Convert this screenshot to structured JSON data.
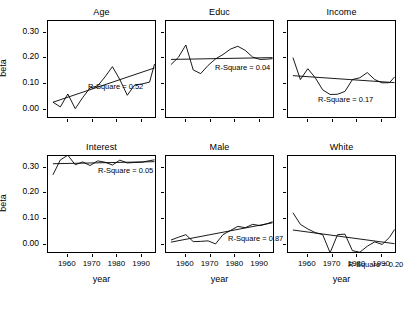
{
  "figure": {
    "xlabel": "year",
    "ylabel": "beta",
    "y_ticks": [
      "0.00",
      "0.10",
      "0.20",
      "0.30"
    ],
    "x_ticks": [
      "1960",
      "1970",
      "1980",
      "1990"
    ]
  },
  "chart_data": {
    "type": "line",
    "title": "",
    "xlabel": "year",
    "ylabel": "beta",
    "xlim": [
      1952,
      1996
    ],
    "ylim": [
      -0.035,
      0.345
    ],
    "grid": false,
    "legend": "none",
    "layout": "2 rows x 3 columns of small-multiple panels",
    "annotation_format": "R-Square = <value>",
    "panels": [
      {
        "title": "Age",
        "r_square": 0.52,
        "r_square_label": "R-Square = 0.52",
        "series": [
          {
            "name": "beta",
            "x": [
              1954,
              1957,
              1960,
              1963,
              1966,
              1969,
              1972,
              1975,
              1978,
              1981,
              1984,
              1987,
              1990,
              1993,
              1995
            ],
            "values": [
              0.03,
              0.012,
              0.062,
              0.005,
              0.048,
              0.086,
              0.093,
              0.128,
              0.168,
              0.118,
              0.057,
              0.097,
              0.101,
              0.108,
              0.178
            ]
          },
          {
            "name": "regression",
            "x": [
              1954,
              1995
            ],
            "values": [
              0.03,
              0.163
            ]
          }
        ]
      },
      {
        "title": "Educ",
        "r_square": 0.04,
        "r_square_label": "R-Square = 0.04",
        "series": [
          {
            "name": "beta",
            "x": [
              1954,
              1957,
              1960,
              1963,
              1966,
              1969,
              1972,
              1975,
              1978,
              1981,
              1984,
              1987,
              1990,
              1993,
              1995
            ],
            "values": [
              0.176,
              0.204,
              0.252,
              0.155,
              0.141,
              0.173,
              0.198,
              0.215,
              0.236,
              0.247,
              0.231,
              0.205,
              0.196,
              0.197,
              0.199
            ]
          },
          {
            "name": "regression",
            "x": [
              1954,
              1995
            ],
            "values": [
              0.196,
              0.203
            ]
          }
        ]
      },
      {
        "title": "Income",
        "r_square": 0.17,
        "r_square_label": "R-Square = 0.17",
        "series": [
          {
            "name": "beta",
            "x": [
              1954,
              1957,
              1960,
              1963,
              1966,
              1969,
              1972,
              1975,
              1978,
              1981,
              1984,
              1987,
              1990,
              1993,
              1995
            ],
            "values": [
              0.203,
              0.118,
              0.16,
              0.125,
              0.078,
              0.06,
              0.061,
              0.072,
              0.118,
              0.125,
              0.145,
              0.118,
              0.105,
              0.106,
              0.128
            ]
          },
          {
            "name": "regression",
            "x": [
              1954,
              1995
            ],
            "values": [
              0.133,
              0.106
            ]
          }
        ]
      },
      {
        "title": "Interest",
        "r_square": 0.05,
        "r_square_label": "R-Square = 0.05",
        "series": [
          {
            "name": "beta",
            "x": [
              1954,
              1957,
              1960,
              1963,
              1966,
              1969,
              1972,
              1975,
              1978,
              1981,
              1984,
              1987,
              1990,
              1993,
              1995
            ],
            "values": [
              0.272,
              0.33,
              0.348,
              0.311,
              0.322,
              0.308,
              0.326,
              0.321,
              0.31,
              0.329,
              0.318,
              0.32,
              0.321,
              0.327,
              0.33
            ]
          },
          {
            "name": "regression",
            "x": [
              1954,
              1995
            ],
            "values": [
              0.315,
              0.323
            ]
          }
        ]
      },
      {
        "title": "Male",
        "r_square": 0.87,
        "r_square_label": "R-Square = 0.87",
        "series": [
          {
            "name": "beta",
            "x": [
              1954,
              1957,
              1960,
              1963,
              1966,
              1969,
              1972,
              1975,
              1978,
              1981,
              1984,
              1987,
              1990,
              1993,
              1995
            ],
            "values": [
              0.019,
              0.03,
              0.04,
              0.013,
              0.014,
              0.016,
              0.004,
              0.04,
              0.056,
              0.072,
              0.067,
              0.08,
              0.075,
              0.083,
              0.09
            ]
          },
          {
            "name": "regression",
            "x": [
              1954,
              1995
            ],
            "values": [
              0.011,
              0.086
            ]
          }
        ]
      },
      {
        "title": "White",
        "r_square": 0.2,
        "r_square_label": "R-Square = 0.20",
        "series": [
          {
            "name": "beta",
            "x": [
              1954,
              1957,
              1960,
              1963,
              1966,
              1969,
              1972,
              1975,
              1978,
              1981,
              1984,
              1987,
              1990,
              1993,
              1995
            ],
            "values": [
              0.125,
              0.08,
              0.062,
              0.048,
              0.04,
              -0.03,
              0.04,
              0.042,
              -0.022,
              -0.028,
              -0.005,
              0.012,
              0.002,
              0.03,
              0.06
            ]
          },
          {
            "name": "regression",
            "x": [
              1954,
              1995
            ],
            "values": [
              0.058,
              0.005
            ]
          }
        ]
      }
    ]
  }
}
